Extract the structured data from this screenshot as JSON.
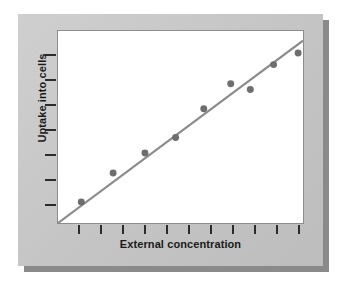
{
  "figure": {
    "panel_color": "#c8c8c8",
    "shadow_color": "#8a8a8a",
    "canvas_color": "#ffffff",
    "frame_color": "#8d8d8d"
  },
  "chart_data": {
    "type": "scatter",
    "title": "",
    "subtitle": "",
    "xlabel": "External concentration",
    "ylabel": "Uptake into cells",
    "xlim": [
      0,
      100
    ],
    "ylim": [
      0,
      100
    ],
    "grid": false,
    "legend": null,
    "axis_tick_labels": {
      "x": [],
      "y": []
    },
    "x_tick_count": 11,
    "y_tick_count": 7,
    "x_tick_positions": [
      8.5,
      17.5,
      26.5,
      35.5,
      44.5,
      53.5,
      62.5,
      71.5,
      80.5,
      89.5,
      97.5
    ],
    "y_tick_positions": [
      12.5,
      25.5,
      38.5,
      51.5,
      64.5,
      77.5,
      90.5
    ],
    "marker": {
      "shape": "circle",
      "color": "#6e6e6e",
      "size_px": 7
    },
    "series": [
      {
        "name": "Uptake measurements",
        "points": [
          {
            "x": 9.5,
            "y": 11.0
          },
          {
            "x": 22.5,
            "y": 26.0
          },
          {
            "x": 35.5,
            "y": 36.5
          },
          {
            "x": 48.0,
            "y": 44.5
          },
          {
            "x": 59.5,
            "y": 59.5
          },
          {
            "x": 70.5,
            "y": 72.5
          },
          {
            "x": 78.5,
            "y": 69.5
          },
          {
            "x": 88.0,
            "y": 82.5
          },
          {
            "x": 98.0,
            "y": 88.5
          }
        ]
      }
    ],
    "fit_line": {
      "name": "linear regression",
      "color": "#8a8a8a",
      "width_px": 2.2,
      "x_start": 0.0,
      "y_start": 0.0,
      "x_end": 100.0,
      "y_end": 95.0
    }
  }
}
